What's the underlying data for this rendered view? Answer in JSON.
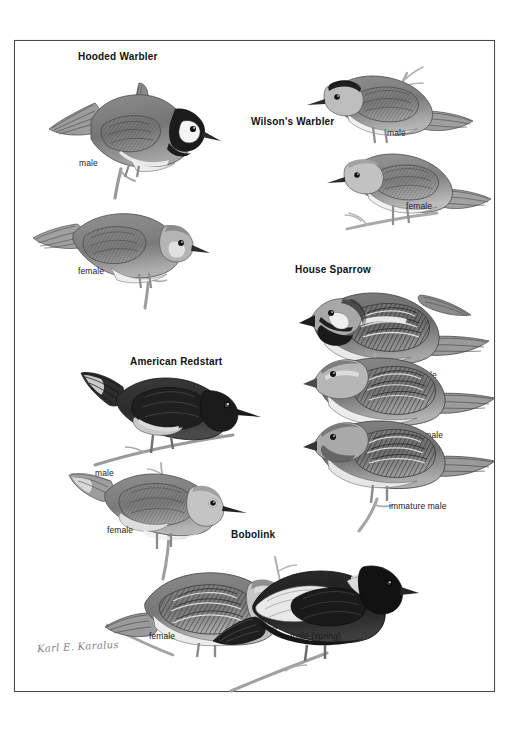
{
  "plate": {
    "background_color": "#ffffff",
    "frame_color": "#4a4a4a",
    "signature": "Karl E. Karalus"
  },
  "species": [
    {
      "id": "hooded-warbler",
      "title": "Hooded Warbler",
      "figures": [
        {
          "id": "hooded-warbler-male",
          "label": "male"
        },
        {
          "id": "hooded-warbler-female",
          "label": "female"
        }
      ]
    },
    {
      "id": "wilsons-warbler",
      "title": "Wilson's Warbler",
      "figures": [
        {
          "id": "wilsons-warbler-male",
          "label": "male"
        },
        {
          "id": "wilsons-warbler-female",
          "label": "female"
        }
      ]
    },
    {
      "id": "house-sparrow",
      "title": "House Sparrow",
      "figures": [
        {
          "id": "house-sparrow-male",
          "label": "male"
        },
        {
          "id": "house-sparrow-female",
          "label": "female"
        },
        {
          "id": "house-sparrow-immature-male",
          "label": "immature male"
        }
      ]
    },
    {
      "id": "american-redstart",
      "title": "American Redstart",
      "figures": [
        {
          "id": "american-redstart-male",
          "label": "male"
        },
        {
          "id": "american-redstart-female",
          "label": "female"
        }
      ]
    },
    {
      "id": "bobolink",
      "title": "Bobolink",
      "figures": [
        {
          "id": "bobolink-female",
          "label": "female"
        },
        {
          "id": "bobolink-male-spring",
          "label": "male (spring)"
        }
      ]
    }
  ]
}
